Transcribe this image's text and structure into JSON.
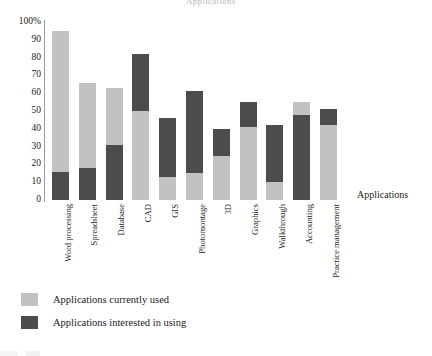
{
  "top_caption": "Applications",
  "axis_title": "Applications",
  "legend": [
    {
      "label": "Applications currently used",
      "color": "#c2c2c2",
      "key": "used"
    },
    {
      "label": "Applications interested in using",
      "color": "#4c4c4c",
      "key": "interested"
    }
  ],
  "chart_data": {
    "type": "bar",
    "stacked": true,
    "title": "Applications",
    "xlabel": "Applications",
    "ylabel": "",
    "ylim": [
      0,
      100
    ],
    "grid": false,
    "legend_position": "bottom-left",
    "ytick_labels": [
      "100%",
      "90",
      "80",
      "70",
      "60",
      "50",
      "40",
      "30",
      "20",
      "10",
      "0"
    ],
    "yticks": [
      100,
      90,
      80,
      70,
      60,
      50,
      40,
      30,
      20,
      10,
      0
    ],
    "categories": [
      "Word processing",
      "Spreadsheet",
      "Database",
      "CAD",
      "GIS",
      "Photomontage",
      "3D",
      "Graphics",
      "Walkthrough",
      "Accounting",
      "Practice management"
    ],
    "series": [
      {
        "name": "Applications currently used",
        "color": "#c2c2c2",
        "values": [
          95,
          66,
          63,
          50,
          13,
          15,
          25,
          41,
          10,
          55,
          42
        ]
      },
      {
        "name": "Applications interested in using",
        "color": "#4c4c4c",
        "values": [
          16,
          18,
          31,
          82,
          46,
          61,
          40,
          55,
          42,
          48,
          51
        ]
      }
    ],
    "bars": [
      {
        "category": "Word processing",
        "used_top": 95,
        "interested_top": 16,
        "order": "interested-bottom"
      },
      {
        "category": "Spreadsheet",
        "used_top": 66,
        "interested_top": 18,
        "order": "interested-bottom"
      },
      {
        "category": "Database",
        "used_top": 63,
        "interested_top": 31,
        "order": "interested-bottom"
      },
      {
        "category": "CAD",
        "used_top": 50,
        "interested_top": 82,
        "order": "used-bottom"
      },
      {
        "category": "GIS",
        "used_top": 13,
        "interested_top": 46,
        "order": "used-bottom"
      },
      {
        "category": "Photomontage",
        "used_top": 15,
        "interested_top": 61,
        "order": "used-bottom"
      },
      {
        "category": "3D",
        "used_top": 25,
        "interested_top": 40,
        "order": "used-bottom"
      },
      {
        "category": "Graphics",
        "used_top": 41,
        "interested_top": 55,
        "order": "used-bottom"
      },
      {
        "category": "Walkthrough",
        "used_top": 10,
        "interested_top": 42,
        "order": "used-bottom"
      },
      {
        "category": "Accounting",
        "used_top": 55,
        "interested_top": 48,
        "order": "interested-bottom"
      },
      {
        "category": "Practice management",
        "used_top": 42,
        "interested_top": 51,
        "order": "used-bottom"
      }
    ]
  }
}
